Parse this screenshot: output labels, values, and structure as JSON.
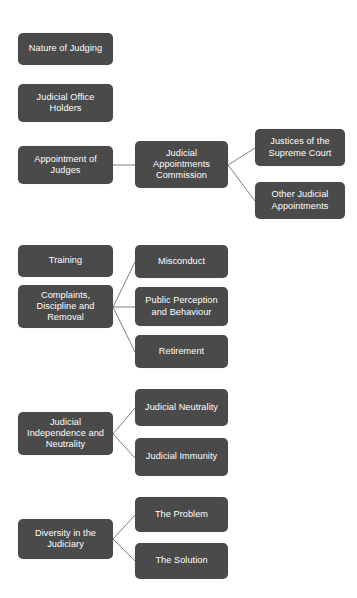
{
  "diagram": {
    "type": "hierarchy-tree",
    "colors": {
      "node_fill": "#4a4a4a",
      "node_text": "#ffffff",
      "connector": "#808080",
      "background": "#ffffff"
    },
    "nodes": [
      {
        "id": "nature-of-judging",
        "label": "Nature of Judging",
        "level": 1,
        "x": 18,
        "y": 33,
        "w": 95,
        "h": 32
      },
      {
        "id": "judicial-office-holders",
        "label": "Judicial Office Holders",
        "level": 1,
        "x": 18,
        "y": 84,
        "w": 95,
        "h": 38
      },
      {
        "id": "appointment-of-judges",
        "label": "Appointment of Judges",
        "level": 1,
        "x": 18,
        "y": 146,
        "w": 95,
        "h": 38
      },
      {
        "id": "judicial-appointments-commission",
        "label": "Judicial Appointments Commission",
        "level": 2,
        "x": 135,
        "y": 141,
        "w": 93,
        "h": 47
      },
      {
        "id": "justices-of-the-supreme-court",
        "label": "Justices of the Supreme Court",
        "level": 3,
        "x": 255,
        "y": 129,
        "w": 90,
        "h": 37
      },
      {
        "id": "other-judicial-appointments",
        "label": "Other Judicial Appointments",
        "level": 3,
        "x": 255,
        "y": 182,
        "w": 90,
        "h": 37
      },
      {
        "id": "training",
        "label": "Training",
        "level": 1,
        "x": 18,
        "y": 245,
        "w": 95,
        "h": 32
      },
      {
        "id": "complaints-discipline-and-removal",
        "label": "Complaints, Discipline and Removal",
        "level": 1,
        "x": 18,
        "y": 285,
        "w": 95,
        "h": 43
      },
      {
        "id": "misconduct",
        "label": "Misconduct",
        "level": 2,
        "x": 135,
        "y": 245,
        "w": 93,
        "h": 33
      },
      {
        "id": "public-perception-and-behaviour",
        "label": "Public Perception and Behaviour",
        "level": 2,
        "x": 135,
        "y": 287,
        "w": 93,
        "h": 39
      },
      {
        "id": "retirement",
        "label": "Retirement",
        "level": 2,
        "x": 135,
        "y": 335,
        "w": 93,
        "h": 33
      },
      {
        "id": "judicial-independence-and-neutrality",
        "label": "Judicial Independence and Neutrality",
        "level": 1,
        "x": 18,
        "y": 412,
        "w": 95,
        "h": 43
      },
      {
        "id": "judicial-neutrality",
        "label": "Judicial Neutrality",
        "level": 2,
        "x": 135,
        "y": 389,
        "w": 93,
        "h": 37
      },
      {
        "id": "judicial-immunity",
        "label": "Judicial Immunity",
        "level": 2,
        "x": 135,
        "y": 438,
        "w": 93,
        "h": 38
      },
      {
        "id": "diversity-in-the-judiciary",
        "label": "Diversity in the Judiciary",
        "level": 1,
        "x": 18,
        "y": 519,
        "w": 95,
        "h": 40
      },
      {
        "id": "the-problem",
        "label": "The Problem",
        "level": 2,
        "x": 135,
        "y": 497,
        "w": 93,
        "h": 35
      },
      {
        "id": "the-solution",
        "label": "The Solution",
        "level": 2,
        "x": 135,
        "y": 543,
        "w": 93,
        "h": 36
      }
    ],
    "connectors": [
      {
        "from": "appointment-of-judges",
        "to": "judicial-appointments-commission",
        "x1": 113,
        "y1": 165,
        "x2": 135,
        "y2": 165
      },
      {
        "from": "judicial-appointments-commission",
        "to": "justices-of-the-supreme-court",
        "x1": 228,
        "y1": 165,
        "x2": 255,
        "y2": 148
      },
      {
        "from": "judicial-appointments-commission",
        "to": "other-judicial-appointments",
        "x1": 228,
        "y1": 165,
        "x2": 255,
        "y2": 201
      },
      {
        "from": "complaints-discipline-and-removal",
        "to": "misconduct",
        "x1": 113,
        "y1": 307,
        "x2": 135,
        "y2": 262
      },
      {
        "from": "complaints-discipline-and-removal",
        "to": "public-perception-and-behaviour",
        "x1": 113,
        "y1": 307,
        "x2": 135,
        "y2": 307
      },
      {
        "from": "complaints-discipline-and-removal",
        "to": "retirement",
        "x1": 113,
        "y1": 307,
        "x2": 135,
        "y2": 352
      },
      {
        "from": "judicial-independence-and-neutrality",
        "to": "judicial-neutrality",
        "x1": 113,
        "y1": 434,
        "x2": 135,
        "y2": 408
      },
      {
        "from": "judicial-independence-and-neutrality",
        "to": "judicial-immunity",
        "x1": 113,
        "y1": 434,
        "x2": 135,
        "y2": 458
      },
      {
        "from": "diversity-in-the-judiciary",
        "to": "the-problem",
        "x1": 113,
        "y1": 539,
        "x2": 135,
        "y2": 515
      },
      {
        "from": "diversity-in-the-judiciary",
        "to": "the-solution",
        "x1": 113,
        "y1": 539,
        "x2": 135,
        "y2": 561
      }
    ]
  }
}
